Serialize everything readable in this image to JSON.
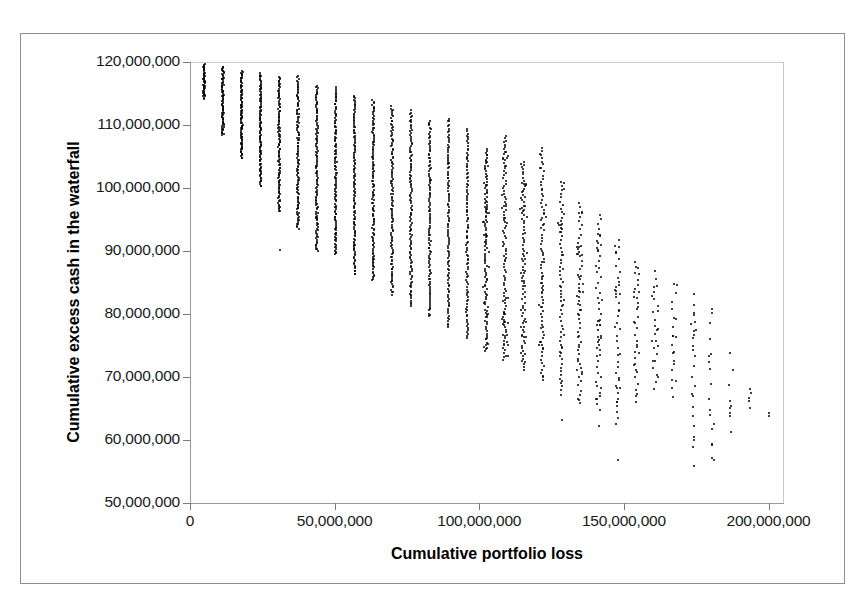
{
  "chart_data": {
    "type": "scatter",
    "title": "",
    "xlabel": "Cumulative portfolio loss",
    "ylabel": "Cumulative excess cash in the waterfall",
    "xlim": [
      0,
      205000000
    ],
    "ylim": [
      50000000,
      120000000
    ],
    "xticks": [
      0,
      50000000,
      100000000,
      150000000,
      200000000
    ],
    "xtick_labels": [
      "0",
      "50,000,000",
      "100,000,000",
      "150,000,000",
      "200,000,000"
    ],
    "yticks": [
      50000000,
      60000000,
      70000000,
      80000000,
      90000000,
      100000000,
      110000000,
      120000000
    ],
    "ytick_labels": [
      "50,000,000",
      "60,000,000",
      "70,000,000",
      "80,000,000",
      "90,000,000",
      "100,000,000",
      "110,000,000",
      "120,000,000"
    ],
    "grid": false,
    "legend": null,
    "marker_color": "#000000",
    "marker_size": 2,
    "columns": [
      {
        "x": 4500000,
        "y_min": 114200000,
        "y_max": 119600000,
        "n": 46,
        "density": "dense"
      },
      {
        "x": 11000000,
        "y_min": 108400000,
        "y_max": 119300000,
        "n": 78,
        "density": "dense"
      },
      {
        "x": 17500000,
        "y_min": 104700000,
        "y_max": 118600000,
        "n": 96,
        "density": "dense"
      },
      {
        "x": 24000000,
        "y_min": 100300000,
        "y_max": 118200000,
        "n": 104,
        "density": "dense"
      },
      {
        "x": 30500000,
        "y_min": 96200000,
        "y_max": 117700000,
        "n": 110,
        "density": "dense"
      },
      {
        "x": 37000000,
        "y_min": 93500000,
        "y_max": 117700000,
        "n": 112,
        "density": "dense"
      },
      {
        "x": 43500000,
        "y_min": 89900000,
        "y_max": 116300000,
        "n": 116,
        "density": "dense"
      },
      {
        "x": 50000000,
        "y_min": 89400000,
        "y_max": 115900000,
        "n": 118,
        "density": "dense"
      },
      {
        "x": 56500000,
        "y_min": 86200000,
        "y_max": 114700000,
        "n": 118,
        "density": "dense"
      },
      {
        "x": 63000000,
        "y_min": 85300000,
        "y_max": 113900000,
        "n": 116,
        "density": "dense"
      },
      {
        "x": 69500000,
        "y_min": 83100000,
        "y_max": 112900000,
        "n": 114,
        "density": "dense"
      },
      {
        "x": 76000000,
        "y_min": 81300000,
        "y_max": 112300000,
        "n": 112,
        "density": "dense"
      },
      {
        "x": 82500000,
        "y_min": 79600000,
        "y_max": 110700000,
        "n": 108,
        "density": "dense"
      },
      {
        "x": 89000000,
        "y_min": 77900000,
        "y_max": 111100000,
        "n": 104,
        "density": "dense"
      },
      {
        "x": 95500000,
        "y_min": 76100000,
        "y_max": 109400000,
        "n": 98,
        "density": "dense"
      },
      {
        "x": 102000000,
        "y_min": 74100000,
        "y_max": 106300000,
        "n": 92,
        "density": "medium"
      },
      {
        "x": 108500000,
        "y_min": 72900000,
        "y_max": 108200000,
        "n": 86,
        "density": "medium"
      },
      {
        "x": 115000000,
        "y_min": 71100000,
        "y_max": 104200000,
        "n": 78,
        "density": "medium"
      },
      {
        "x": 121500000,
        "y_min": 69500000,
        "y_max": 106400000,
        "n": 68,
        "density": "medium"
      },
      {
        "x": 128000000,
        "y_min": 67200000,
        "y_max": 100900000,
        "n": 56,
        "density": "medium"
      },
      {
        "x": 134500000,
        "y_min": 65800000,
        "y_max": 97600000,
        "n": 46,
        "density": "sparse"
      },
      {
        "x": 141000000,
        "y_min": 64900000,
        "y_max": 95900000,
        "n": 38,
        "density": "sparse"
      },
      {
        "x": 147500000,
        "y_min": 62400000,
        "y_max": 91800000,
        "n": 30,
        "density": "sparse"
      },
      {
        "x": 154000000,
        "y_min": 66100000,
        "y_max": 88400000,
        "n": 24,
        "density": "sparse"
      },
      {
        "x": 160500000,
        "y_min": 68100000,
        "y_max": 86700000,
        "n": 18,
        "density": "sparse"
      },
      {
        "x": 167000000,
        "y_min": 66900000,
        "y_max": 84800000,
        "n": 14,
        "density": "sparse"
      },
      {
        "x": 173500000,
        "y_min": 58900000,
        "y_max": 83100000,
        "n": 16,
        "density": "sparse"
      },
      {
        "x": 180000000,
        "y_min": 56900000,
        "y_max": 80800000,
        "n": 11,
        "density": "sparse"
      },
      {
        "x": 186500000,
        "y_min": 61300000,
        "y_max": 73700000,
        "n": 6,
        "density": "sparse"
      },
      {
        "x": 193000000,
        "y_min": 65200000,
        "y_max": 68200000,
        "n": 3,
        "density": "sparse"
      },
      {
        "x": 199000000,
        "y_min": 64200000,
        "y_max": 64200000,
        "n": 1,
        "density": "sparse"
      }
    ],
    "outliers": [
      {
        "x": 30500000,
        "y": 90200000
      },
      {
        "x": 37000000,
        "y": 97100000
      },
      {
        "x": 43500000,
        "y": 95200000
      },
      {
        "x": 50000000,
        "y": 92600000
      },
      {
        "x": 56500000,
        "y": 90900000
      },
      {
        "x": 63000000,
        "y": 88700000
      },
      {
        "x": 69500000,
        "y": 87200000
      },
      {
        "x": 82500000,
        "y": 101300000
      },
      {
        "x": 89000000,
        "y": 103900000
      },
      {
        "x": 95500000,
        "y": 104600000
      },
      {
        "x": 128000000,
        "y": 63100000
      },
      {
        "x": 141000000,
        "y": 62200000
      },
      {
        "x": 147500000,
        "y": 56900000
      },
      {
        "x": 173500000,
        "y": 55800000
      },
      {
        "x": 180000000,
        "y": 57100000
      }
    ]
  },
  "axes": {
    "x_title": "Cumulative portfolio loss",
    "y_title": "Cumulative excess cash in the waterfall"
  }
}
